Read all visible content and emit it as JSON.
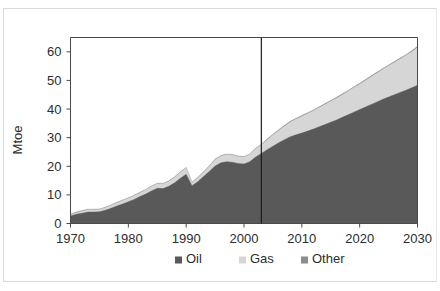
{
  "chart_data": {
    "type": "area",
    "stacked": true,
    "title": "",
    "subtitle": "",
    "xlabel": "",
    "ylabel": "Mtoe",
    "xlim": [
      1970,
      2030
    ],
    "ylim": [
      0,
      65
    ],
    "ytick_labels": [
      "0",
      "10",
      "20",
      "30",
      "40",
      "50",
      "60"
    ],
    "yticks": [
      0,
      10,
      20,
      30,
      40,
      50,
      60
    ],
    "xtick_labels": [
      "1970",
      "1980",
      "1990",
      "2000",
      "2010",
      "2020",
      "2030"
    ],
    "xticks": [
      1970,
      1980,
      1990,
      2000,
      2010,
      2020,
      2030
    ],
    "grid": false,
    "legend_position": "bottom",
    "legend_entries": [
      "Oil",
      "Gas",
      "Other"
    ],
    "annotations": [
      {
        "name": "history-projection-divider",
        "type": "vline",
        "x": 2003
      }
    ],
    "x": [
      1970,
      1971,
      1972,
      1973,
      1974,
      1975,
      1976,
      1977,
      1978,
      1979,
      1980,
      1981,
      1982,
      1983,
      1984,
      1985,
      1986,
      1987,
      1988,
      1989,
      1990,
      1991,
      1992,
      1993,
      1994,
      1995,
      1996,
      1997,
      1998,
      1999,
      2000,
      2001,
      2002,
      2003,
      2004,
      2005,
      2006,
      2007,
      2008,
      2009,
      2010,
      2011,
      2012,
      2013,
      2014,
      2015,
      2016,
      2017,
      2018,
      2019,
      2020,
      2021,
      2022,
      2023,
      2024,
      2025,
      2026,
      2027,
      2028,
      2029,
      2030
    ],
    "series": [
      {
        "name": "Oil",
        "color": "#595959",
        "values": [
          2.6,
          3.2,
          3.6,
          4.0,
          4.0,
          4.1,
          4.6,
          5.3,
          6.1,
          6.8,
          7.6,
          8.4,
          9.4,
          10.3,
          11.4,
          12.3,
          12.2,
          13.0,
          14.2,
          15.8,
          17.2,
          13.2,
          14.6,
          16.4,
          18.2,
          20.1,
          21.2,
          21.6,
          21.4,
          21.0,
          20.8,
          21.6,
          23.2,
          24.5,
          25.8,
          27.0,
          28.2,
          29.3,
          30.3,
          31.0,
          31.6,
          32.3,
          33.0,
          33.8,
          34.6,
          35.4,
          36.2,
          37.1,
          38.0,
          38.9,
          39.8,
          40.7,
          41.6,
          42.5,
          43.4,
          44.2,
          45.0,
          45.8,
          46.6,
          47.4,
          48.3
        ]
      },
      {
        "name": "Gas",
        "color": "#d6d6d6",
        "values": [
          0.5,
          0.6,
          0.7,
          0.8,
          0.8,
          0.8,
          0.9,
          1.0,
          1.1,
          1.2,
          1.2,
          1.3,
          1.3,
          1.4,
          1.5,
          1.6,
          1.6,
          1.7,
          1.9,
          2.1,
          2.2,
          1.1,
          1.3,
          1.5,
          1.8,
          2.2,
          2.4,
          2.5,
          2.5,
          2.4,
          2.4,
          2.5,
          2.9,
          3.0,
          3.4,
          3.9,
          4.3,
          4.7,
          5.1,
          5.5,
          5.8,
          6.1,
          6.4,
          6.7,
          7.0,
          7.3,
          7.6,
          7.9,
          8.2,
          8.6,
          8.9,
          9.3,
          9.7,
          10.1,
          10.5,
          10.9,
          11.3,
          11.7,
          12.1,
          12.6,
          13.2
        ]
      },
      {
        "name": "Other",
        "color": "#8c8c8c",
        "values": [
          0.2,
          0.2,
          0.2,
          0.2,
          0.2,
          0.2,
          0.2,
          0.2,
          0.2,
          0.2,
          0.2,
          0.2,
          0.2,
          0.2,
          0.2,
          0.2,
          0.2,
          0.2,
          0.2,
          0.2,
          0.2,
          0.2,
          0.2,
          0.2,
          0.2,
          0.2,
          0.2,
          0.2,
          0.2,
          0.2,
          0.2,
          0.2,
          0.2,
          0.2,
          0.3,
          0.3,
          0.3,
          0.3,
          0.3,
          0.3,
          0.3,
          0.3,
          0.3,
          0.3,
          0.3,
          0.3,
          0.3,
          0.3,
          0.3,
          0.3,
          0.3,
          0.3,
          0.3,
          0.3,
          0.3,
          0.3,
          0.3,
          0.3,
          0.3,
          0.4,
          0.4
        ]
      }
    ]
  },
  "axes": {
    "y_title": "Mtoe"
  },
  "legend": {
    "items": [
      {
        "label": "Oil",
        "color": "#595959"
      },
      {
        "label": "Gas",
        "color": "#d6d6d6"
      },
      {
        "label": "Other",
        "color": "#8c8c8c"
      }
    ]
  },
  "colors": {
    "oil": "#595959",
    "gas": "#d6d6d6",
    "other": "#8c8c8c",
    "frame": "#4a4a4a",
    "divider": "#1c1c1c",
    "text": "#2d2d2d",
    "outer_border": "#d9d9d9",
    "background": "#ffffff"
  }
}
